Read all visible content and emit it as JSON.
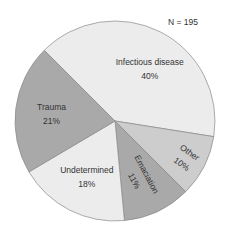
{
  "chart_data": {
    "type": "pie",
    "title": "",
    "annotation": "N = 195",
    "start_angle_deg": 315,
    "direction": "clockwise",
    "slices": [
      {
        "label": "Infectious disease",
        "value": 40,
        "value_label": "40%",
        "color": "#ececec"
      },
      {
        "label": "Other",
        "value": 10,
        "value_label": "10%",
        "color": "#cdcdcd"
      },
      {
        "label": "Emaciation",
        "value": 11,
        "value_label": "11%",
        "color": "#a9a9a9"
      },
      {
        "label": "Undetermined",
        "value": 18,
        "value_label": "18%",
        "color": "#ececec"
      },
      {
        "label": "Trauma",
        "value": 21,
        "value_label": "21%",
        "color": "#a9a9a9"
      }
    ]
  }
}
